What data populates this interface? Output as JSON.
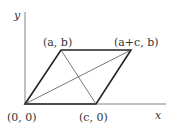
{
  "diagram": {
    "axes": {
      "x_label": "x",
      "y_label": "y"
    },
    "vertices": [
      {
        "id": "O",
        "label": "(0,  0)",
        "coords": [
          0,
          0
        ]
      },
      {
        "id": "A",
        "label": "(a,  b)",
        "coords": [
          "a",
          "b"
        ]
      },
      {
        "id": "B",
        "label": "(a+c,  b)",
        "coords": [
          "a+c",
          "b"
        ]
      },
      {
        "id": "C",
        "label": "(c,  0)",
        "coords": [
          "c",
          0
        ]
      }
    ],
    "edges": [
      [
        "O",
        "A"
      ],
      [
        "A",
        "B"
      ],
      [
        "B",
        "C"
      ],
      [
        "C",
        "O"
      ]
    ],
    "diagonals": [
      [
        "O",
        "B"
      ],
      [
        "A",
        "C"
      ]
    ],
    "colors": {
      "stroke": "#222222",
      "diagonal": "#555555",
      "text": "#333333"
    }
  }
}
